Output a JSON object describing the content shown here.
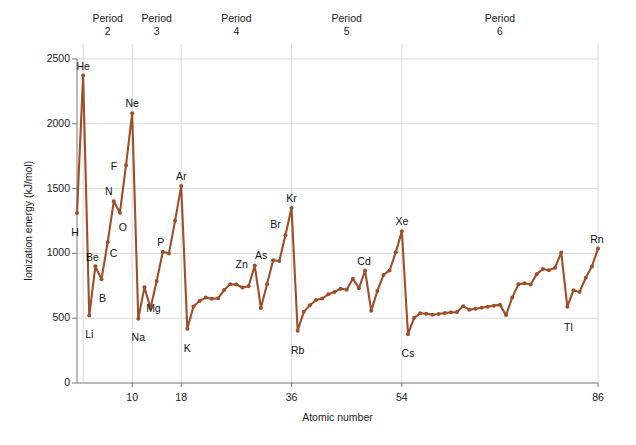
{
  "chart_data": {
    "type": "line",
    "title": "",
    "xlabel": "Atomic number",
    "ylabel": "Ionization energy (kJ/mol)",
    "xlim": [
      1,
      86
    ],
    "ylim": [
      0,
      2500
    ],
    "xticks": [
      10,
      18,
      36,
      54,
      86
    ],
    "yticks": [
      0,
      500,
      1000,
      1500,
      2000,
      2500
    ],
    "grid": true,
    "legend": "none",
    "line_color": "#9c4f28",
    "marker": "circle",
    "period_separators": [
      2,
      10,
      18,
      36,
      54,
      86
    ],
    "period_bands": [
      {
        "label": "Period",
        "number": "2",
        "start": 2,
        "end": 10
      },
      {
        "label": "Period",
        "number": "3",
        "start": 10,
        "end": 18
      },
      {
        "label": "Period",
        "number": "4",
        "start": 18,
        "end": 36
      },
      {
        "label": "Period",
        "number": "5",
        "start": 36,
        "end": 54
      },
      {
        "label": "Period",
        "number": "6",
        "start": 54,
        "end": 86
      }
    ],
    "x": [
      1,
      2,
      3,
      4,
      5,
      6,
      7,
      8,
      9,
      10,
      11,
      12,
      13,
      14,
      15,
      16,
      17,
      18,
      19,
      20,
      21,
      22,
      23,
      24,
      25,
      26,
      27,
      28,
      29,
      30,
      31,
      32,
      33,
      34,
      35,
      36,
      37,
      38,
      39,
      40,
      41,
      42,
      43,
      44,
      45,
      46,
      47,
      48,
      49,
      50,
      51,
      52,
      53,
      54,
      55,
      56,
      57,
      58,
      59,
      60,
      61,
      62,
      63,
      64,
      65,
      66,
      67,
      68,
      69,
      70,
      71,
      72,
      73,
      74,
      75,
      76,
      77,
      78,
      79,
      80,
      81,
      82,
      83,
      84,
      85,
      86
    ],
    "values": [
      1312,
      2372,
      520,
      900,
      801,
      1086,
      1402,
      1314,
      1681,
      2081,
      496,
      738,
      578,
      787,
      1012,
      1000,
      1251,
      1521,
      419,
      590,
      633,
      659,
      651,
      653,
      717,
      762,
      760,
      737,
      746,
      906,
      579,
      762,
      947,
      941,
      1140,
      1351,
      403,
      549,
      600,
      640,
      652,
      684,
      702,
      728,
      720,
      805,
      731,
      868,
      558,
      709,
      834,
      869,
      1008,
      1170,
      376,
      503,
      538,
      534,
      527,
      533,
      540,
      545,
      547,
      593,
      566,
      573,
      581,
      589,
      597,
      603,
      524,
      659,
      761,
      770,
      760,
      840,
      880,
      870,
      890,
      1007,
      589,
      716,
      703,
      812,
      899,
      1037
    ],
    "annotations": [
      {
        "element": "H",
        "z": 1,
        "dx": -2,
        "dy": 20
      },
      {
        "element": "He",
        "z": 2,
        "dx": 0,
        "dy": -9
      },
      {
        "element": "Li",
        "z": 3,
        "dx": 0,
        "dy": 19
      },
      {
        "element": "Be",
        "z": 4,
        "dx": -3,
        "dy": -8
      },
      {
        "element": "B",
        "z": 5,
        "dx": 1,
        "dy": 20
      },
      {
        "element": "C",
        "z": 6,
        "dx": 6,
        "dy": 12
      },
      {
        "element": "N",
        "z": 7,
        "dx": -5,
        "dy": -9
      },
      {
        "element": "O",
        "z": 8,
        "dx": 3,
        "dy": 15
      },
      {
        "element": "F",
        "z": 9,
        "dx": -12,
        "dy": 2
      },
      {
        "element": "Ne",
        "z": 10,
        "dx": 0,
        "dy": -9
      },
      {
        "element": "Na",
        "z": 11,
        "dx": 0,
        "dy": 19
      },
      {
        "element": "Mg",
        "z": 12,
        "dx": 9,
        "dy": 22
      },
      {
        "element": "P",
        "z": 15,
        "dx": -2,
        "dy": -9
      },
      {
        "element": "Ar",
        "z": 18,
        "dx": 0,
        "dy": -9
      },
      {
        "element": "K",
        "z": 19,
        "dx": 0,
        "dy": 20
      },
      {
        "element": "Zn",
        "z": 30,
        "dx": -13,
        "dy": -1
      },
      {
        "element": "As",
        "z": 33,
        "dx": -12,
        "dy": -4
      },
      {
        "element": "Br",
        "z": 35,
        "dx": -10,
        "dy": -10
      },
      {
        "element": "Kr",
        "z": 36,
        "dx": 0,
        "dy": -9
      },
      {
        "element": "Rb",
        "z": 37,
        "dx": 0,
        "dy": 20
      },
      {
        "element": "Cd",
        "z": 48,
        "dx": -1,
        "dy": -9
      },
      {
        "element": "Xe",
        "z": 54,
        "dx": 0,
        "dy": -9
      },
      {
        "element": "Cs",
        "z": 55,
        "dx": 0,
        "dy": 20
      },
      {
        "element": "Tl",
        "z": 81,
        "dx": 1,
        "dy": 21
      },
      {
        "element": "Rn",
        "z": 86,
        "dx": -1,
        "dy": -9
      }
    ]
  }
}
